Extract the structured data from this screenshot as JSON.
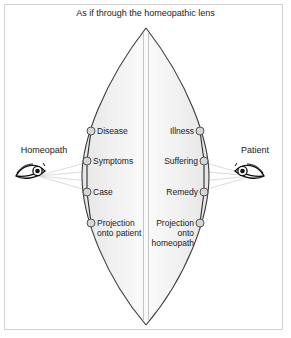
{
  "figure": {
    "title": "As if through the homeopathic lens",
    "frame_color": "#d2d2d2",
    "lens_stroke": "#3a3a3a",
    "ray_color": "#d8d8d8",
    "node_fill": "#d6d6d6",
    "node_stroke": "#555555",
    "text_color": "#1a1a1a"
  },
  "actors": {
    "left": {
      "label": "Homeopath",
      "icon": "eye-icon"
    },
    "right": {
      "label": "Patient",
      "icon": "eye-icon"
    }
  },
  "nodes": {
    "left": [
      {
        "label": "Disease",
        "x": 91,
        "y": 131
      },
      {
        "label": "Symptoms",
        "x": 87,
        "y": 161
      },
      {
        "label": "Case",
        "x": 87,
        "y": 192
      },
      {
        "label": "Projection\nonto patient",
        "x": 91,
        "y": 223
      }
    ],
    "right": [
      {
        "label": "Illness",
        "x": 200,
        "y": 131
      },
      {
        "label": "Suffering",
        "x": 204,
        "y": 161
      },
      {
        "label": "Remedy",
        "x": 204,
        "y": 192
      },
      {
        "label": "Projection\nonto\nhomeopath",
        "x": 200,
        "y": 223
      }
    ]
  },
  "lens": {
    "apex_top": {
      "x": 146,
      "y": 28
    },
    "apex_bottom": {
      "x": 146,
      "y": 325
    },
    "left_extreme_x": 82,
    "right_extreme_x": 209,
    "center_line_x": 146
  }
}
